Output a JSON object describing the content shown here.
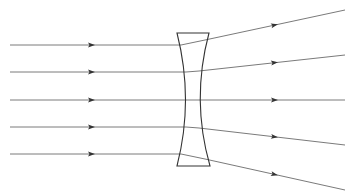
{
  "diagram": {
    "type": "optics-ray-diagram",
    "colors": {
      "ray": "#6b6b6b",
      "lens": "#333333",
      "arrow": "#333333",
      "background": "#ffffff"
    },
    "lens": {
      "top_y": 33,
      "bottom_y": 166,
      "top_left_x": 177,
      "top_right_x": 209,
      "bottom_left_x": 177,
      "bottom_right_x": 210,
      "waist_left_x": 188,
      "waist_right_x": 197,
      "waist_y": 100
    },
    "rays": [
      {
        "start": [
          10,
          45
        ],
        "hit": [
          181,
          45
        ],
        "exit": [
          205,
          40
        ],
        "end": [
          345,
          10
        ],
        "arrow_in_x": 92,
        "arrow_out_x": 275
      },
      {
        "start": [
          10,
          72
        ],
        "hit": [
          186,
          72
        ],
        "exit": [
          199,
          71
        ],
        "end": [
          345,
          55
        ],
        "arrow_in_x": 92,
        "arrow_out_x": 275
      },
      {
        "start": [
          10,
          100
        ],
        "hit": [
          188,
          100
        ],
        "exit": [
          197,
          100
        ],
        "end": [
          345,
          100
        ],
        "arrow_in_x": 92,
        "arrow_out_x": 275
      },
      {
        "start": [
          10,
          127
        ],
        "hit": [
          186,
          127
        ],
        "exit": [
          199,
          128
        ],
        "end": [
          345,
          145
        ],
        "arrow_in_x": 92,
        "arrow_out_x": 275
      },
      {
        "start": [
          10,
          154
        ],
        "hit": [
          181,
          154
        ],
        "exit": [
          205,
          159
        ],
        "end": [
          345,
          190
        ],
        "arrow_in_x": 92,
        "arrow_out_x": 275
      }
    ]
  }
}
